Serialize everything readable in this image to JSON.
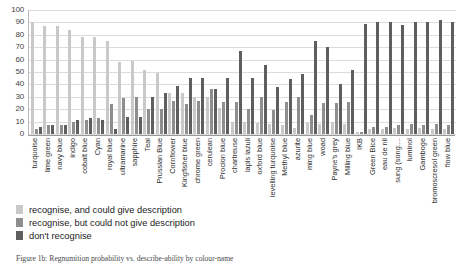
{
  "chart_data": {
    "type": "bar",
    "title": "",
    "xlabel": "",
    "ylabel": "",
    "ylim": [
      0,
      100
    ],
    "yticks": [
      0,
      10,
      20,
      30,
      40,
      50,
      60,
      70,
      80,
      90,
      100
    ],
    "grid": true,
    "legend_position": "below-plot-left",
    "categories": [
      "turquoise",
      "lime green",
      "navy blue",
      "indigo",
      "cobalt blue",
      "Cyan",
      "royal blue",
      "ultramarine",
      "sapphire",
      "Teal",
      "Prussian Blue",
      "Cornflower",
      "Kingfisher blue",
      "chrome green",
      "cerulean",
      "Procion blue",
      "chartreuse",
      "lapis lazuli",
      "oxford blue",
      "levelling turquoise",
      "Methyl blue",
      "azurite",
      "ming blue",
      "woad",
      "Payne's grey",
      "Milling blue",
      "IKB",
      "Green Bice",
      "eau de nil",
      "sung (song....",
      "luminol",
      "Gamboge",
      "bromoscresol green",
      "flow blue"
    ],
    "series": [
      {
        "name": "recognise, and could give description",
        "color": "#c9c9c9",
        "values": [
          90,
          87,
          87,
          84,
          78,
          78,
          75,
          58,
          59,
          52,
          49,
          33,
          33,
          30,
          30,
          21,
          10,
          10,
          9,
          8,
          7,
          5,
          9,
          8,
          10,
          8,
          2,
          4,
          4,
          5,
          4,
          5,
          4,
          4
        ]
      },
      {
        "name": "recognise, but could not give description",
        "color": "#8e8e8e",
        "values": [
          4,
          7,
          7,
          10,
          11,
          13,
          24,
          29,
          30,
          20,
          20,
          27,
          24,
          27,
          36,
          26,
          26,
          20,
          30,
          19,
          26,
          30,
          15,
          25,
          25,
          26,
          2,
          6,
          6,
          7,
          8,
          7,
          8,
          7
        ]
      },
      {
        "name": "don't recognise",
        "color": "#5e5e5e",
        "values": [
          6,
          7,
          7,
          11,
          13,
          11,
          4,
          14,
          14,
          30,
          33,
          39,
          45,
          45,
          36,
          45,
          67,
          45,
          56,
          38,
          44,
          48,
          75,
          70,
          40,
          52,
          89,
          90,
          90,
          88,
          90,
          90,
          92,
          90
        ]
      }
    ],
    "legend": [
      "recognise, and could give description",
      "recognise, but could not give description",
      "don't recognise"
    ]
  },
  "caption": {
    "text": "Figure 1b: Regnumition probability vs. describe-ability by colour-name"
  }
}
